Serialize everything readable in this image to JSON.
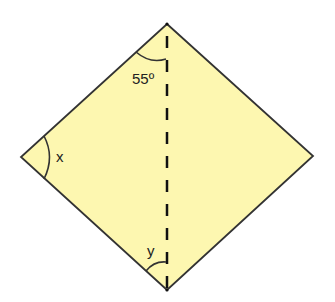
{
  "figure": {
    "shape": "rhombus",
    "fill_color": "#fdf7b0",
    "stroke_color": "#333333",
    "labels": {
      "top_angle": "55º",
      "left_angle": "x",
      "bottom_angle": "y"
    },
    "diagonal": "vertical dashed line from top vertex to bottom vertex"
  }
}
